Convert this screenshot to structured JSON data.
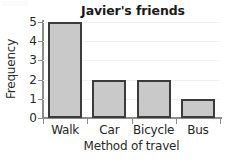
{
  "chart_data": {
    "type": "bar",
    "title": "Javier's friends",
    "xlabel": "Method of travel",
    "ylabel": "Frequency",
    "categories": [
      "Walk",
      "Car",
      "Bicycle",
      "Bus"
    ],
    "values": [
      5,
      2,
      2,
      1
    ],
    "ylim": [
      0,
      5
    ],
    "yticks": [
      "0",
      "1",
      "2",
      "3",
      "4",
      "5"
    ],
    "grid": "faint-horizontal",
    "legend": "none",
    "bar_fill_color": "#c9c9c9",
    "bar_edge_color": "#3b3b3b",
    "axis_color": "#8c8c8c",
    "background_color": "#ffffff"
  }
}
